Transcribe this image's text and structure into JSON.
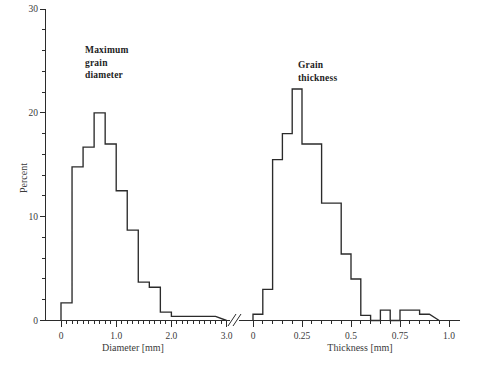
{
  "figure": {
    "background_color": "#ffffff",
    "line_color": "#2b2b2b",
    "width": 485,
    "height": 373
  },
  "yaxis": {
    "label": "Percent",
    "ticks": [
      0,
      10,
      20,
      30
    ],
    "tick_labels": [
      "0",
      "10",
      "20",
      "30"
    ],
    "minor_step": 2,
    "range": [
      0,
      30
    ]
  },
  "annotations": {
    "left": "Maximum\ngrain\ndiameter",
    "right": "Grain\nthickness"
  },
  "axis_break": {
    "present": true,
    "symbol": "//"
  },
  "chart_data": [
    {
      "type": "bar",
      "title": "Maximum grain diameter",
      "xlabel": "Diameter [mm]",
      "ylabel": "Percent",
      "xlim": [
        -0.1,
        3.2
      ],
      "ylim": [
        0,
        30
      ],
      "grid": false,
      "legend": "none",
      "bin_width": 0.2,
      "xticks": [
        0,
        1.0,
        2.0,
        3.0
      ],
      "xtick_labels": [
        "0",
        "1.0",
        "2.0",
        "3.0"
      ],
      "xminor_step": 0.1,
      "bin_edges": [
        0.0,
        0.2,
        0.4,
        0.6,
        0.8,
        1.0,
        1.2,
        1.4,
        1.6,
        1.8,
        2.0,
        2.2,
        2.4,
        2.6,
        2.8
      ],
      "categories": [
        "0.0-0.2",
        "0.2-0.4",
        "0.4-0.6",
        "0.6-0.8",
        "0.8-1.0",
        "1.0-1.2",
        "1.2-1.4",
        "1.4-1.6",
        "1.6-1.8",
        "1.8-2.0",
        "2.0-2.2",
        "2.2-2.4",
        "2.4-2.6",
        "2.6-2.8"
      ],
      "values": [
        1.7,
        14.8,
        16.7,
        20.0,
        17.0,
        12.5,
        8.7,
        3.7,
        3.2,
        0.8,
        0.4,
        0.4,
        0.4,
        0.4
      ]
    },
    {
      "type": "bar",
      "title": "Grain thickness",
      "xlabel": "Thickness [mm]",
      "ylabel": "Percent",
      "xlim": [
        -0.03,
        1.03
      ],
      "ylim": [
        0,
        30
      ],
      "grid": false,
      "legend": "none",
      "bin_width": 0.05,
      "xticks": [
        0,
        0.25,
        0.5,
        0.75,
        1.0
      ],
      "xtick_labels": [
        "0",
        "0.25",
        "0.5",
        "0.75",
        "1.0"
      ],
      "xminor_step": 0.05,
      "bin_edges": [
        0.0,
        0.05,
        0.1,
        0.15,
        0.2,
        0.25,
        0.3,
        0.35,
        0.4,
        0.45,
        0.5,
        0.55,
        0.6,
        0.65,
        0.7,
        0.75,
        0.8,
        0.85,
        0.9
      ],
      "categories": [
        "0.00-0.05",
        "0.05-0.10",
        "0.10-0.15",
        "0.15-0.20",
        "0.20-0.25",
        "0.25-0.30",
        "0.30-0.35",
        "0.35-0.40",
        "0.40-0.45",
        "0.45-0.50",
        "0.50-0.55",
        "0.55-0.60",
        "0.60-0.65",
        "0.65-0.70",
        "0.70-0.75",
        "0.75-0.80",
        "0.80-0.85",
        "0.85-0.90"
      ],
      "values": [
        0.6,
        3.0,
        15.5,
        18.0,
        22.3,
        17.0,
        17.0,
        11.3,
        11.3,
        6.4,
        4.0,
        0.5,
        0.0,
        1.0,
        0.0,
        1.0,
        1.0,
        0.6
      ]
    }
  ]
}
